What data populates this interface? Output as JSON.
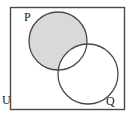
{
  "figure": {
    "type": "venn-diagram",
    "width": 134,
    "height": 119,
    "background_color": "#ffffff",
    "shaded_region_description": "P only (P minus Q)",
    "shade_color": "#d9d9d9",
    "stroke_color": "#4a4a4a",
    "label_color": "#1a1a1a"
  },
  "universe": {
    "label": "U",
    "rect": {
      "x": 10,
      "y": 7,
      "width": 115,
      "height": 103
    },
    "label_pos": {
      "x": 2,
      "y": 104
    }
  },
  "sets": [
    {
      "name": "set-p",
      "label": "P",
      "cx": 58,
      "cy": 41,
      "r": 29,
      "shaded": true,
      "label_pos": {
        "x": 24,
        "y": 21
      }
    },
    {
      "name": "set-q",
      "label": "Q",
      "cx": 88,
      "cy": 74,
      "r": 30,
      "shaded": false,
      "label_pos": {
        "x": 106,
        "y": 105
      }
    }
  ]
}
